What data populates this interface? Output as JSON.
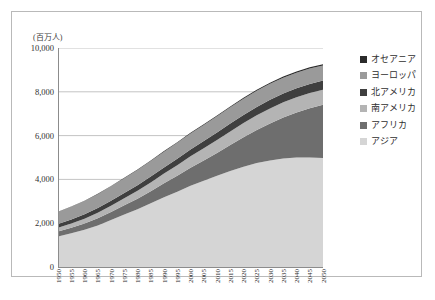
{
  "chart_data": {
    "type": "area",
    "title": "",
    "subtitle": "",
    "xlabel": "",
    "ylabel": "(百万人)",
    "unit_label": "(百万人)",
    "grid": true,
    "legend_position": "right",
    "stacked": true,
    "ylim": [
      0,
      10000
    ],
    "yticks": [
      "0",
      "2,000",
      "4,000",
      "6,000",
      "8,000",
      "10,000"
    ],
    "ytick_values": [
      0,
      2000,
      4000,
      6000,
      8000,
      10000
    ],
    "categories": [
      "1950",
      "1955",
      "1960",
      "1965",
      "1970",
      "1975",
      "1980",
      "1985",
      "1990",
      "1995",
      "2000",
      "2005",
      "2010",
      "2015",
      "2020",
      "2025",
      "2030",
      "2035",
      "2040",
      "2045",
      "2050"
    ],
    "x": [
      1950,
      1955,
      1960,
      1965,
      1970,
      1975,
      1980,
      1985,
      1990,
      1995,
      2000,
      2005,
      2010,
      2015,
      2020,
      2025,
      2030,
      2035,
      2040,
      2045,
      2050
    ],
    "series": [
      {
        "name": "アジア",
        "color": "#d5d5d5",
        "values": [
          1396,
          1541,
          1700,
          1899,
          2143,
          2397,
          2637,
          2907,
          3181,
          3437,
          3714,
          3944,
          4165,
          4385,
          4581,
          4747,
          4868,
          4952,
          4995,
          5003,
          4978
        ]
      },
      {
        "name": "アフリカ",
        "color": "#6e6e6e",
        "values": [
          228,
          254,
          285,
          322,
          366,
          419,
          481,
          557,
          642,
          727,
          819,
          924,
          1044,
          1186,
          1341,
          1509,
          1688,
          1873,
          2060,
          2246,
          2428
        ]
      },
      {
        "name": "南アメリカ",
        "color": "#b4b4b4",
        "values": [
          169,
          191,
          220,
          252,
          287,
          323,
          361,
          399,
          442,
          481,
          521,
          557,
          590,
          621,
          648,
          670,
          686,
          696,
          700,
          699,
          693
        ]
      },
      {
        "name": "北アメリカ",
        "color": "#3f3f3f",
        "values": [
          172,
          187,
          204,
          219,
          231,
          243,
          254,
          266,
          280,
          297,
          313,
          329,
          344,
          357,
          369,
          380,
          390,
          398,
          405,
          410,
          415
        ]
      },
      {
        "name": "ヨーロッパ",
        "color": "#9a9a9a",
        "values": [
          549,
          577,
          605,
          634,
          657,
          676,
          693,
          706,
          721,
          727,
          727,
          729,
          738,
          743,
          744,
          741,
          735,
          726,
          715,
          703,
          691
        ]
      },
      {
        "name": "オセアニア",
        "color": "#2b2b2b",
        "values": [
          13,
          14,
          16,
          18,
          20,
          21,
          23,
          25,
          27,
          29,
          31,
          33,
          37,
          40,
          43,
          46,
          49,
          51,
          54,
          56,
          57
        ]
      }
    ],
    "legend_order_top_to_bottom": [
      "オセアニア",
      "ヨーロッパ",
      "北アメリカ",
      "南アメリカ",
      "アフリカ",
      "アジア"
    ],
    "stack_order_bottom_to_top": [
      "アジア",
      "アフリカ",
      "南アメリカ",
      "北アメリカ",
      "ヨーロッパ",
      "オセアニア"
    ]
  },
  "legend": {
    "items": [
      {
        "label": "オセアニア",
        "color": "#2b2b2b"
      },
      {
        "label": "ヨーロッパ",
        "color": "#9a9a9a"
      },
      {
        "label": "北アメリカ",
        "color": "#3f3f3f"
      },
      {
        "label": "南アメリカ",
        "color": "#b4b4b4"
      },
      {
        "label": "アフリカ",
        "color": "#6e6e6e"
      },
      {
        "label": "アジア",
        "color": "#d5d5d5"
      }
    ]
  }
}
